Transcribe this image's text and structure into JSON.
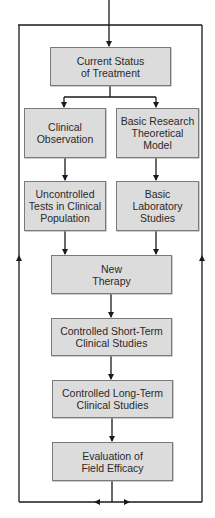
{
  "diagram": {
    "type": "flowchart",
    "colors": {
      "node_fill": "#dcdcdc",
      "node_border": "#7a7a7a",
      "line": "#1a1a1a",
      "text": "#2a2a2a"
    },
    "nodes": [
      {
        "id": "current-status",
        "label": "Current Status\nof Treatment"
      },
      {
        "id": "clinical-observation",
        "label": "Clinical\nObservation"
      },
      {
        "id": "basic-research",
        "label": "Basic Research\nTheoretical\nModel"
      },
      {
        "id": "uncontrolled-tests",
        "label": "Uncontrolled\nTests in Clinical\nPopulation"
      },
      {
        "id": "basic-laboratory",
        "label": "Basic\nLaboratory\nStudies"
      },
      {
        "id": "new-therapy",
        "label": "New\nTherapy"
      },
      {
        "id": "controlled-short-term",
        "label": "Controlled Short-Term\nClinical Studies"
      },
      {
        "id": "controlled-long-term",
        "label": "Controlled Long-Term\nClinical Studies"
      },
      {
        "id": "evaluation-field-efficacy",
        "label": "Evaluation of\nField Efficacy"
      }
    ],
    "edges": [
      {
        "from": "feedback-loop",
        "to": "current-status"
      },
      {
        "from": "current-status",
        "to": "clinical-observation"
      },
      {
        "from": "current-status",
        "to": "basic-research"
      },
      {
        "from": "clinical-observation",
        "to": "uncontrolled-tests"
      },
      {
        "from": "basic-research",
        "to": "basic-laboratory"
      },
      {
        "from": "uncontrolled-tests",
        "to": "new-therapy"
      },
      {
        "from": "basic-laboratory",
        "to": "new-therapy"
      },
      {
        "from": "new-therapy",
        "to": "controlled-short-term"
      },
      {
        "from": "controlled-short-term",
        "to": "controlled-long-term"
      },
      {
        "from": "controlled-long-term",
        "to": "evaluation-field-efficacy"
      },
      {
        "from": "evaluation-field-efficacy",
        "to": "feedback-loop"
      }
    ]
  }
}
